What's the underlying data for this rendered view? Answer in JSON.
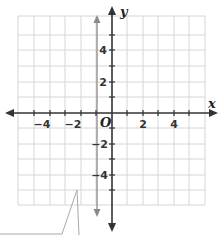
{
  "diagram": {
    "type": "coordinate-plane",
    "axes": {
      "x_label": "x",
      "y_label": "y",
      "origin_label": "O",
      "x_range": [
        -6,
        6
      ],
      "y_range": [
        -6,
        6
      ],
      "grid_spacing": 1,
      "x_tick_labels": [
        "−4",
        "−2",
        "2",
        "4"
      ],
      "y_tick_labels": [
        "4",
        "2",
        "−2",
        "−4"
      ]
    },
    "lines": [
      {
        "name": "vertical-line",
        "equation": "x = -1",
        "color": "#888888"
      }
    ],
    "callout": {
      "pointer_to": [
        -1.5,
        -5
      ]
    },
    "colors": {
      "grid": "#d0d0d0",
      "axis": "#333333",
      "graphed_line": "#8a8a8a"
    }
  }
}
